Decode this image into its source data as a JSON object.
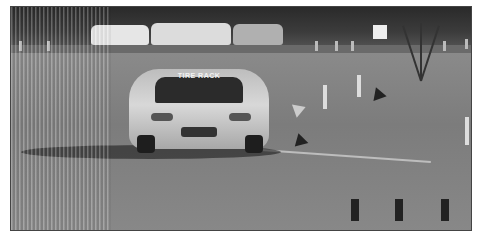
{
  "photo": {
    "subject": "Silver sports coupe cornering on an autocross course",
    "windshield_banner": "TIRE RACK",
    "colors": {
      "background": "#ffffff",
      "sky_trees": "#2a2a2a",
      "pavement": "#808080",
      "car": "#c8c8c8"
    }
  }
}
